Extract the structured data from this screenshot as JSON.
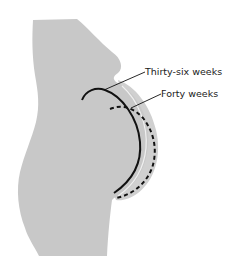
{
  "diagram": {
    "labels": {
      "thirty_six_weeks": "Thirty-six weeks",
      "forty_weeks": "Forty weeks"
    },
    "legend": [
      {
        "label": "Thirty-six weeks",
        "line_style": "solid"
      },
      {
        "label": "Forty weeks",
        "line_style": "dashed"
      }
    ],
    "colors": {
      "body": "#c8c8c8",
      "belly_outer": "#d2d2d2",
      "highlight": "#f2f2f2",
      "line": "#111111",
      "background": "#ffffff"
    }
  }
}
